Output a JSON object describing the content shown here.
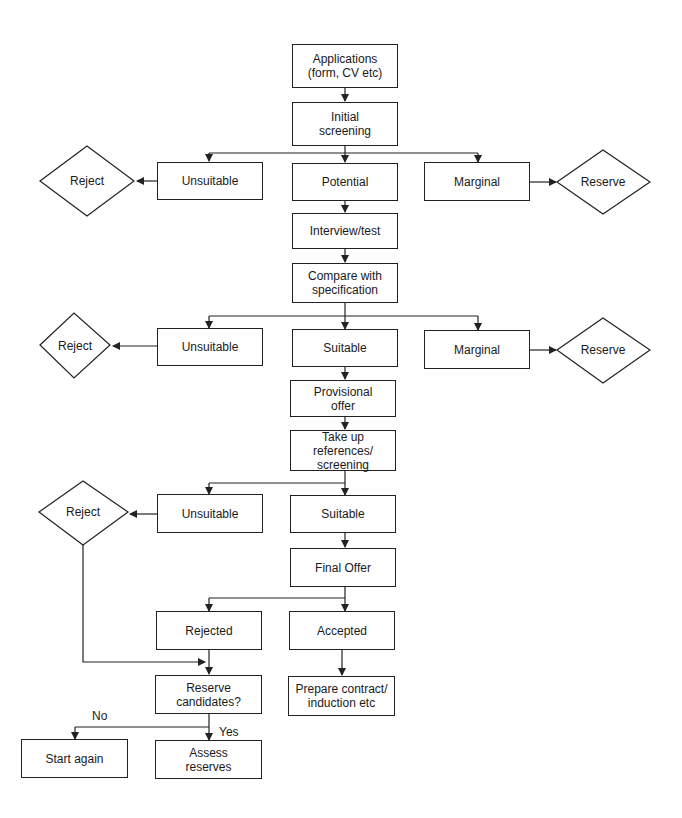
{
  "diagram": {
    "type": "flowchart",
    "title": "",
    "nodes": {
      "applications": "Applications\n(form, CV etc)",
      "initial_screening": "Initial\nscreening",
      "unsuitable_1": "Unsuitable",
      "potential": "Potential",
      "marginal_1": "Marginal",
      "reject_1": "Reject",
      "reserve_1": "Reserve",
      "interview": "Interview/test",
      "compare": "Compare with\nspecification",
      "unsuitable_2": "Unsuitable",
      "suitable_2": "Suitable",
      "marginal_2": "Marginal",
      "reject_2": "Reject",
      "reserve_2": "Reserve",
      "provisional": "Provisional\noffer",
      "references": "Take up\nreferences/\nscreening",
      "unsuitable_3": "Unsuitable",
      "suitable_3": "Suitable",
      "reject_3": "Reject",
      "final_offer": "Final Offer",
      "rejected": "Rejected",
      "accepted": "Accepted",
      "reserve_candidates": "Reserve\ncandidates?",
      "prepare_contract": "Prepare contract/\ninduction etc",
      "start_again": "Start again",
      "assess_reserves": "Assess\nreserves"
    },
    "edge_labels": {
      "no": "No",
      "yes": "Yes"
    },
    "edges": [
      [
        "applications",
        "initial_screening"
      ],
      [
        "initial_screening",
        "unsuitable_1"
      ],
      [
        "initial_screening",
        "potential"
      ],
      [
        "initial_screening",
        "marginal_1"
      ],
      [
        "unsuitable_1",
        "reject_1"
      ],
      [
        "marginal_1",
        "reserve_1"
      ],
      [
        "potential",
        "interview"
      ],
      [
        "interview",
        "compare"
      ],
      [
        "compare",
        "unsuitable_2"
      ],
      [
        "compare",
        "suitable_2"
      ],
      [
        "compare",
        "marginal_2"
      ],
      [
        "unsuitable_2",
        "reject_2"
      ],
      [
        "marginal_2",
        "reserve_2"
      ],
      [
        "suitable_2",
        "provisional"
      ],
      [
        "provisional",
        "references"
      ],
      [
        "references",
        "unsuitable_3"
      ],
      [
        "references",
        "suitable_3"
      ],
      [
        "unsuitable_3",
        "reject_3"
      ],
      [
        "suitable_3",
        "final_offer"
      ],
      [
        "final_offer",
        "rejected"
      ],
      [
        "final_offer",
        "accepted"
      ],
      [
        "reject_3",
        "reserve_candidates"
      ],
      [
        "rejected",
        "reserve_candidates"
      ],
      [
        "accepted",
        "prepare_contract"
      ],
      [
        "reserve_candidates",
        "start_again",
        "No"
      ],
      [
        "reserve_candidates",
        "assess_reserves",
        "Yes"
      ]
    ]
  }
}
